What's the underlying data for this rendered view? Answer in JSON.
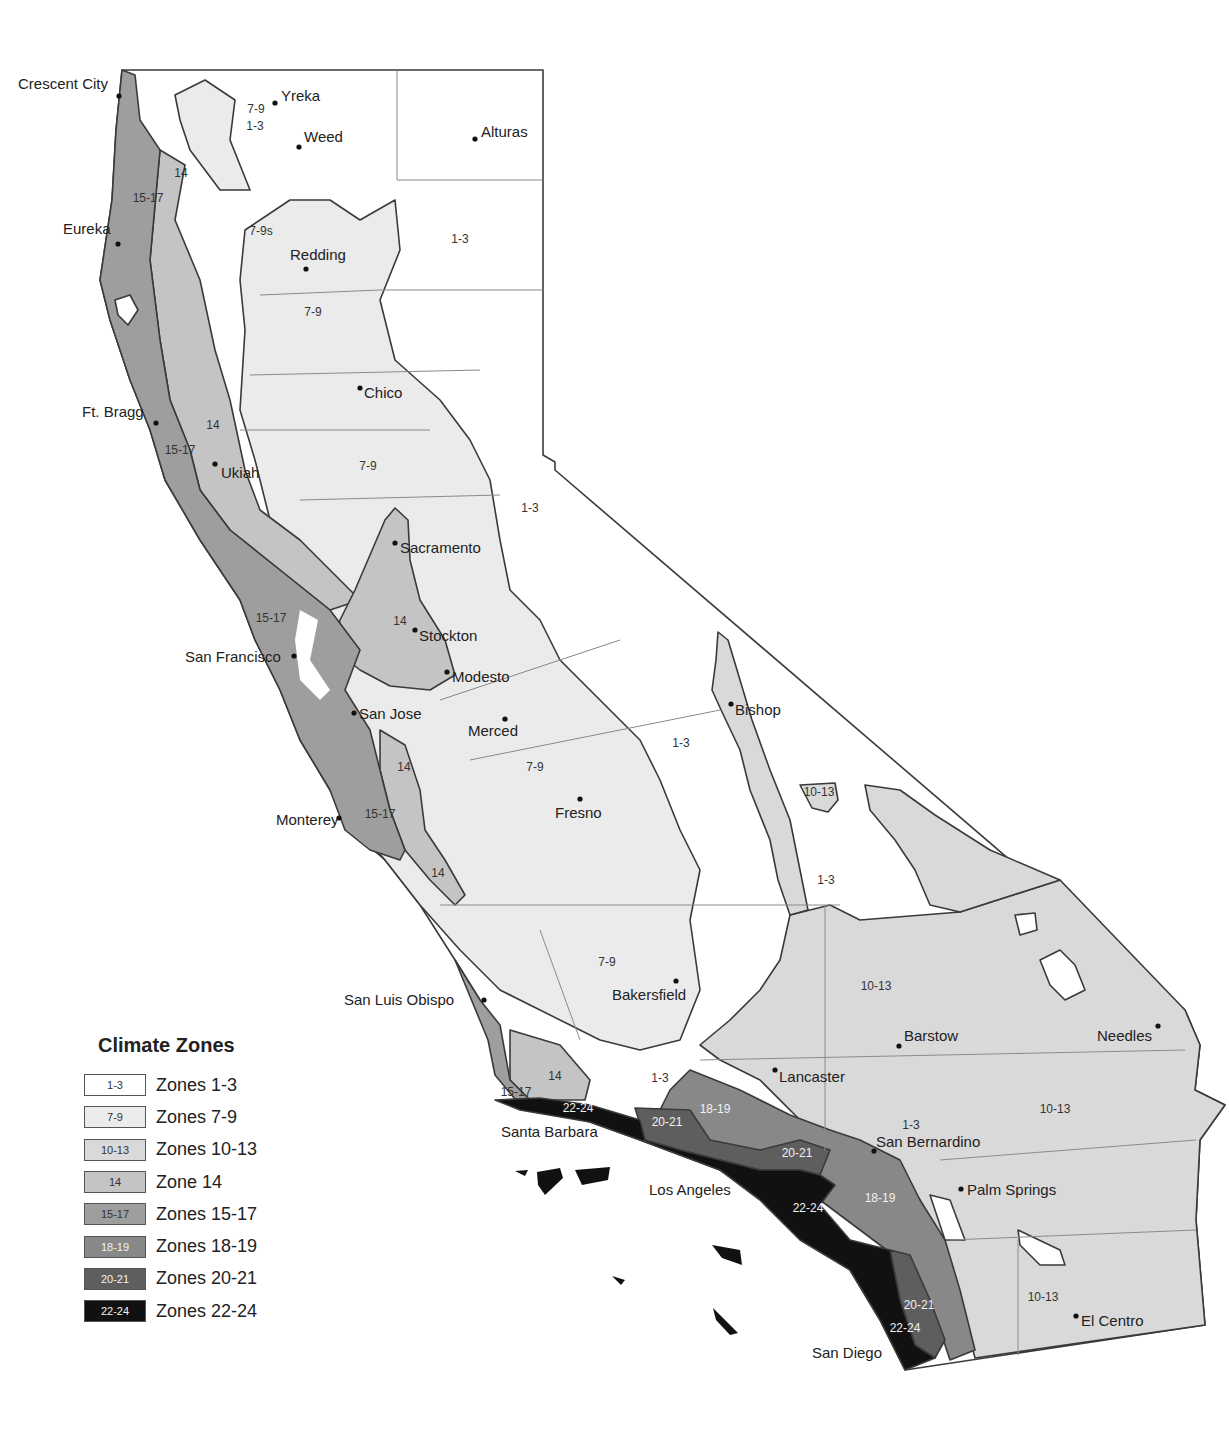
{
  "title": "Climate Zones",
  "colors": {
    "zone_1_3": "#ffffff",
    "zone_7_9": "#ebebeb",
    "zone_10_13": "#d9d9d9",
    "zone_14": "#c4c4c4",
    "zone_15_17": "#9e9e9e",
    "zone_18_19": "#888888",
    "zone_20_21": "#5e5e5e",
    "zone_22_24": "#111111",
    "border": "#3a3a3a",
    "county_line": "#8a8a8a"
  },
  "legend": [
    {
      "swatch": "1-3",
      "label": "Zones 1-3",
      "color": "#ffffff",
      "light": false
    },
    {
      "swatch": "7-9",
      "label": "Zones 7-9",
      "color": "#ebebeb",
      "light": false
    },
    {
      "swatch": "10-13",
      "label": "Zones 10-13",
      "color": "#d9d9d9",
      "light": false
    },
    {
      "swatch": "14",
      "label": "Zone 14",
      "color": "#c4c4c4",
      "light": false
    },
    {
      "swatch": "15-17",
      "label": "Zones 15-17",
      "color": "#9e9e9e",
      "light": false
    },
    {
      "swatch": "18-19",
      "label": "Zones 18-19",
      "color": "#888888",
      "light": true
    },
    {
      "swatch": "20-21",
      "label": "Zones 20-21",
      "color": "#5e5e5e",
      "light": true
    },
    {
      "swatch": "22-24",
      "label": "Zones 22-24",
      "color": "#111111",
      "light": true
    }
  ],
  "cities": [
    {
      "name": "Crescent City",
      "x": 119,
      "y": 96,
      "lx": 18,
      "ly": 89
    },
    {
      "name": "Yreka",
      "x": 275,
      "y": 103,
      "lx": 281,
      "ly": 101
    },
    {
      "name": "Weed",
      "x": 299,
      "y": 147,
      "lx": 304,
      "ly": 142
    },
    {
      "name": "Alturas",
      "x": 475,
      "y": 139,
      "lx": 481,
      "ly": 137
    },
    {
      "name": "Eureka",
      "x": 118,
      "y": 244,
      "lx": 63,
      "ly": 234
    },
    {
      "name": "Redding",
      "x": 306,
      "y": 269,
      "lx": 290,
      "ly": 260
    },
    {
      "name": "Chico",
      "x": 360,
      "y": 388,
      "lx": 364,
      "ly": 398
    },
    {
      "name": "Ft. Bragg",
      "x": 156,
      "y": 423,
      "lx": 82,
      "ly": 417
    },
    {
      "name": "Ukiah",
      "x": 215,
      "y": 464,
      "lx": 221,
      "ly": 478
    },
    {
      "name": "Sacramento",
      "x": 395,
      "y": 543,
      "lx": 400,
      "ly": 553
    },
    {
      "name": "Stockton",
      "x": 415,
      "y": 630,
      "lx": 419,
      "ly": 641
    },
    {
      "name": "San Francisco",
      "x": 294,
      "y": 656,
      "lx": 185,
      "ly": 662
    },
    {
      "name": "Modesto",
      "x": 447,
      "y": 672,
      "lx": 452,
      "ly": 682
    },
    {
      "name": "San Jose",
      "x": 354,
      "y": 713,
      "lx": 359,
      "ly": 719
    },
    {
      "name": "Merced",
      "x": 505,
      "y": 719,
      "lx": 468,
      "ly": 736
    },
    {
      "name": "Bishop",
      "x": 731,
      "y": 704,
      "lx": 735,
      "ly": 715
    },
    {
      "name": "Monterey",
      "x": 339,
      "y": 818,
      "lx": 276,
      "ly": 825
    },
    {
      "name": "Fresno",
      "x": 580,
      "y": 799,
      "lx": 555,
      "ly": 818
    },
    {
      "name": "Bakersfield",
      "x": 676,
      "y": 981,
      "lx": 612,
      "ly": 1000
    },
    {
      "name": "San Luis Obispo",
      "x": 484,
      "y": 1000,
      "lx": 344,
      "ly": 1005
    },
    {
      "name": "Barstow",
      "x": 899,
      "y": 1046,
      "lx": 904,
      "ly": 1041
    },
    {
      "name": "Needles",
      "x": 1158,
      "y": 1026,
      "lx": 1097,
      "ly": 1041
    },
    {
      "name": "Lancaster",
      "x": 775,
      "y": 1070,
      "lx": 779,
      "ly": 1082
    },
    {
      "name": "Santa Barbara",
      "x": null,
      "y": null,
      "lx": 501,
      "ly": 1137
    },
    {
      "name": "San Bernardino",
      "x": 874,
      "y": 1151,
      "lx": 876,
      "ly": 1147
    },
    {
      "name": "Palm Springs",
      "x": 961,
      "y": 1189,
      "lx": 967,
      "ly": 1195
    },
    {
      "name": "Los Angeles",
      "x": null,
      "y": null,
      "lx": 649,
      "ly": 1195
    },
    {
      "name": "El Centro",
      "x": 1076,
      "y": 1316,
      "lx": 1081,
      "ly": 1326
    },
    {
      "name": "San Diego",
      "x": null,
      "y": null,
      "lx": 812,
      "ly": 1358
    }
  ],
  "zone_labels": [
    {
      "text": "7-9",
      "x": 256,
      "y": 113,
      "light": false
    },
    {
      "text": "1-3",
      "x": 255,
      "y": 130,
      "light": false
    },
    {
      "text": "14",
      "x": 181,
      "y": 177,
      "light": false
    },
    {
      "text": "15-17",
      "x": 148,
      "y": 202,
      "light": false
    },
    {
      "text": "7-9s",
      "x": 261,
      "y": 235,
      "light": false
    },
    {
      "text": "1-3",
      "x": 460,
      "y": 243,
      "light": false
    },
    {
      "text": "7-9",
      "x": 313,
      "y": 316,
      "light": false
    },
    {
      "text": "14",
      "x": 213,
      "y": 429,
      "light": false
    },
    {
      "text": "15-17",
      "x": 180,
      "y": 454,
      "light": false
    },
    {
      "text": "7-9",
      "x": 368,
      "y": 470,
      "light": false
    },
    {
      "text": "1-3",
      "x": 530,
      "y": 512,
      "light": false
    },
    {
      "text": "15-17",
      "x": 271,
      "y": 622,
      "light": false
    },
    {
      "text": "14",
      "x": 400,
      "y": 625,
      "light": false
    },
    {
      "text": "1-3",
      "x": 681,
      "y": 747,
      "light": false
    },
    {
      "text": "7-9",
      "x": 535,
      "y": 771,
      "light": false
    },
    {
      "text": "14",
      "x": 404,
      "y": 771,
      "light": false
    },
    {
      "text": "10-13",
      "x": 819,
      "y": 796,
      "light": false
    },
    {
      "text": "15-17",
      "x": 380,
      "y": 818,
      "light": false
    },
    {
      "text": "1-3",
      "x": 826,
      "y": 884,
      "light": false
    },
    {
      "text": "14",
      "x": 438,
      "y": 877,
      "light": false
    },
    {
      "text": "7-9",
      "x": 607,
      "y": 966,
      "light": false
    },
    {
      "text": "10-13",
      "x": 876,
      "y": 990,
      "light": false
    },
    {
      "text": "14",
      "x": 555,
      "y": 1080,
      "light": false
    },
    {
      "text": "1-3",
      "x": 660,
      "y": 1082,
      "light": false
    },
    {
      "text": "15-17",
      "x": 516,
      "y": 1096,
      "light": false
    },
    {
      "text": "10-13",
      "x": 1055,
      "y": 1113,
      "light": false
    },
    {
      "text": "18-19",
      "x": 715,
      "y": 1113,
      "light": true
    },
    {
      "text": "22-24",
      "x": 578,
      "y": 1112,
      "light": true
    },
    {
      "text": "1-3",
      "x": 911,
      "y": 1129,
      "light": false
    },
    {
      "text": "20-21",
      "x": 667,
      "y": 1126,
      "light": true
    },
    {
      "text": "20-21",
      "x": 797,
      "y": 1157,
      "light": true
    },
    {
      "text": "18-19",
      "x": 880,
      "y": 1202,
      "light": true
    },
    {
      "text": "22-24",
      "x": 808,
      "y": 1212,
      "light": true
    },
    {
      "text": "10-13",
      "x": 1043,
      "y": 1301,
      "light": false
    },
    {
      "text": "20-21",
      "x": 919,
      "y": 1309,
      "light": true
    },
    {
      "text": "22-24",
      "x": 905,
      "y": 1332,
      "light": true
    }
  ]
}
